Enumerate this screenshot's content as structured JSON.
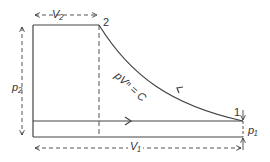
{
  "diagram": {
    "type": "p-V diagram",
    "curve_label": "pVⁿ = C",
    "state_labels": {
      "state_1": "1",
      "state_2": "2"
    },
    "dimension_labels": {
      "v2": "V₂",
      "v1": "V₁",
      "p2": "p₂",
      "p1": "p₁"
    },
    "colors": {
      "line": "#333333",
      "background": "#ffffff"
    }
  }
}
